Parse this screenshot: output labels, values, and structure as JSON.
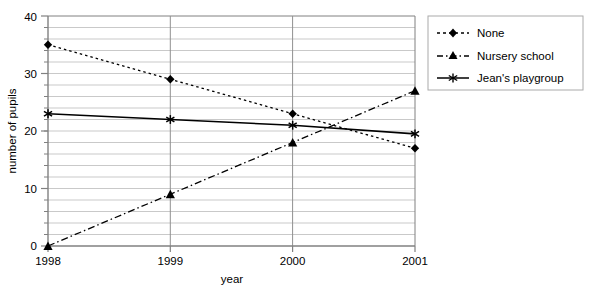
{
  "chart_data": {
    "type": "line",
    "title": "",
    "xlabel": "year",
    "ylabel": "number of pupils",
    "categories": [
      "1998",
      "1999",
      "2000",
      "2001"
    ],
    "ylim": [
      0,
      40
    ],
    "xlim_categories": 4,
    "yticks": [
      "0",
      "10",
      "20",
      "30",
      "40"
    ],
    "ytick_values": [
      0,
      10,
      20,
      30,
      40
    ],
    "minor_gridline_step": 2,
    "grid": true,
    "grid_color": "#c8c8c8",
    "axis_color": "#808080",
    "legend_position": "right",
    "legend_border_color": "#aaaaaa",
    "series": [
      {
        "name": "None",
        "values": [
          35,
          29,
          23,
          17
        ],
        "marker": "diamond",
        "line_style": "dotted",
        "color": "#000000"
      },
      {
        "name": "Nursery school",
        "values": [
          0,
          9,
          18,
          27
        ],
        "marker": "triangle",
        "line_style": "dashdot",
        "color": "#000000"
      },
      {
        "name": "Jean's playgroup",
        "values": [
          23,
          22,
          21,
          19.5
        ],
        "marker": "asterisk",
        "line_style": "solid",
        "color": "#000000"
      }
    ]
  },
  "axes": {
    "y_title": "number of pupils",
    "x_title": "year",
    "y_tick_0": "0",
    "y_tick_1": "10",
    "y_tick_2": "20",
    "y_tick_3": "30",
    "y_tick_4": "40",
    "x_tick_0": "1998",
    "x_tick_1": "1999",
    "x_tick_2": "2000",
    "x_tick_3": "2001"
  },
  "legend": {
    "items": [
      {
        "label": "None",
        "marker": "diamond-icon",
        "line_style": "dotted"
      },
      {
        "label": "Nursery school",
        "marker": "triangle-icon",
        "line_style": "dashdot"
      },
      {
        "label": "Jean's playgroup",
        "marker": "asterisk-icon",
        "line_style": "solid"
      }
    ]
  }
}
